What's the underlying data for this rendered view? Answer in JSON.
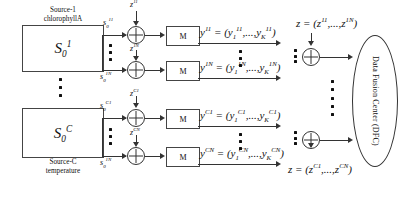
{
  "diagram": {
    "sources": [
      {
        "caption_line1": "Source-1",
        "caption_line2": "chlorophyllA",
        "block_label": "S",
        "block_sub": "0",
        "block_sup": "1"
      },
      {
        "caption_line1": "Source-C",
        "caption_line2": "temperature",
        "block_label": "S",
        "block_sub": "0",
        "block_sup": "C"
      }
    ],
    "signal_labels": [
      {
        "base": "s",
        "sub": "0",
        "sup": "11"
      },
      {
        "base": "s",
        "sub": "0",
        "sup": "1N"
      },
      {
        "base": "s",
        "sub": "0",
        "sup": "C1"
      },
      {
        "base": "s",
        "sub": "0",
        "sup": "1N"
      }
    ],
    "noise_labels": [
      {
        "base": "z",
        "sup": "11"
      },
      {
        "base": "z",
        "sup": "1N"
      },
      {
        "base": "z",
        "sup": "C1"
      },
      {
        "base": "z",
        "sup": "CN"
      }
    ],
    "quantizer_label": "M",
    "observations": [
      {
        "lhs_base": "y",
        "lhs_sup": "11",
        "rhs": "= (y",
        "rhs_sub1": "1",
        "rhs_sup1": "11",
        "rhs_mid": ",...,y",
        "rhs_sub2": "K",
        "rhs_sup2": "11",
        "rhs_close": ")"
      },
      {
        "lhs_base": "y",
        "lhs_sup": "1N",
        "rhs": "= (y",
        "rhs_sub1": "1",
        "rhs_sup1": "1N",
        "rhs_mid": ",...,y",
        "rhs_sub2": "K",
        "rhs_sup2": "1N",
        "rhs_close": ")"
      },
      {
        "lhs_base": "y",
        "lhs_sup": "C1",
        "rhs": "= (y",
        "rhs_sub1": "1",
        "rhs_sup1": "C1",
        "rhs_mid": ",...,y",
        "rhs_sub2": "K",
        "rhs_sup2": "C1",
        "rhs_close": ")"
      },
      {
        "lhs_base": "y",
        "lhs_sup": "CN",
        "rhs": "= (y",
        "rhs_sub1": "1",
        "rhs_sup1": "CN",
        "rhs_mid": ",...,y",
        "rhs_sub2": "K",
        "rhs_sup2": "CN",
        "rhs_close": ")"
      }
    ],
    "vectors": [
      {
        "lhs": "z",
        "eq": "= (z",
        "sup1": "11",
        "mid": ",...,z",
        "sup2": "1N",
        "close": ")"
      },
      {
        "lhs": "z",
        "eq": "= (z",
        "sup1": "C1",
        "mid": ",...,z",
        "sup2": "CN",
        "close": ")"
      }
    ],
    "fusion_center": {
      "label": "Data Fusion Center (DFC)"
    },
    "colors": {
      "stroke": "#333333",
      "text": "#111111",
      "background": "#ffffff"
    }
  }
}
